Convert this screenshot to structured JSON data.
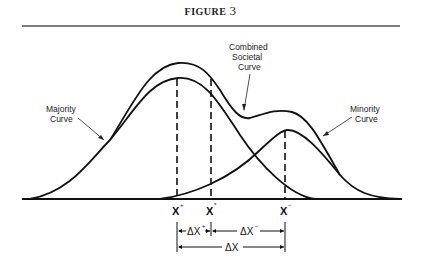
{
  "figure": {
    "title_word": "FIGURE",
    "title_number": "3"
  },
  "labels": {
    "majority": [
      "Majority",
      "Curve"
    ],
    "minority": [
      "Minority",
      "Curve"
    ],
    "combined": [
      "Combined",
      "Societal",
      "Curve"
    ]
  },
  "x_markers": [
    {
      "base": "X",
      "sup": "+"
    },
    {
      "base": "X",
      "sup": "*"
    },
    {
      "base": "X",
      "sup": "−"
    }
  ],
  "deltas": {
    "plus": {
      "base": "ΔX",
      "sup": "+"
    },
    "minus": {
      "base": "ΔX",
      "sup": "−"
    },
    "total": {
      "base": "ΔX"
    }
  },
  "colors": {
    "ink": "#111111",
    "rule": "#555555"
  }
}
